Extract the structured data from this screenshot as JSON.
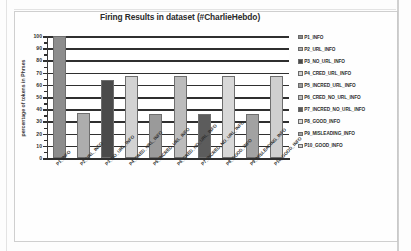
{
  "chart_data": {
    "type": "bar",
    "title": "Firing Results in dataset    (#CharlieHebdo)",
    "xlabel": "",
    "ylabel": "percentage of tokens in  Phrses",
    "ylim": [
      0,
      100
    ],
    "ytick_labels": [
      "100",
      "90",
      "80",
      "70",
      "60",
      "50",
      "40",
      "30",
      "20",
      "10",
      "0"
    ],
    "ytick_values": [
      100,
      90,
      80,
      70,
      60,
      50,
      40,
      30,
      20,
      10,
      0
    ],
    "grid": true,
    "legend_position": "right",
    "categories": [
      "P1_INFO",
      "P2_URL_INFO",
      "P3_NO_URL_INFO",
      "P4_CRED_URL_INFO",
      "P5_INCRED_URL_INFO",
      "P6_CRED_NO_URL_INFO",
      "P7_INCRED_NO_URL_INFO",
      "P8_GOOD_INFO",
      "P9_MISLEADING_INFO",
      "P10_GOOD_INFO"
    ],
    "values": [
      100,
      37,
      64,
      67,
      36,
      67,
      36,
      67,
      36,
      67
    ],
    "bar_colors": [
      "#8d8d8d",
      "#adadad",
      "#4a4a4a",
      "#d2d2d2",
      "#9a9a9a",
      "#bcbcbc",
      "#5c5c5c",
      "#d8d8d8",
      "#a2a2a2",
      "#cfcfcf"
    ],
    "legend": [
      {
        "label": "P1_INFO",
        "color": "#8d8d8d"
      },
      {
        "label": "P2_URL_INFO",
        "color": "#adadad"
      },
      {
        "label": "P3_NO_URL_INFO",
        "color": "#4a4a4a"
      },
      {
        "label": "P4_CRED_URL_INFO",
        "color": "#d2d2d2"
      },
      {
        "label": "P5_INCRED_URL_INFO",
        "color": "#9a9a9a"
      },
      {
        "label": "P6_CRED_NO_URL_INFO",
        "color": "#bcbcbc"
      },
      {
        "label": "P7_INCRED_NO_URL_INFO",
        "color": "#5c5c5c"
      },
      {
        "label": "P8_GOOD_INFO",
        "color": "#d8d8d8"
      },
      {
        "label": "P9_MISLEADING_INFO",
        "color": "#a2a2a2"
      },
      {
        "label": "P10_GOOD_INFO",
        "color": "#cfcfcf"
      }
    ]
  }
}
